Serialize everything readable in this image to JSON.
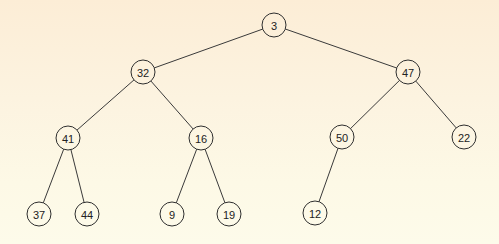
{
  "diagram": {
    "type": "binary-tree",
    "node_radius": 12,
    "nodes": [
      {
        "id": "n3",
        "label": "3",
        "x": 274,
        "y": 25
      },
      {
        "id": "n32",
        "label": "32",
        "x": 143,
        "y": 72
      },
      {
        "id": "n47",
        "label": "47",
        "x": 408,
        "y": 72
      },
      {
        "id": "n41",
        "label": "41",
        "x": 68,
        "y": 138
      },
      {
        "id": "n16",
        "label": "16",
        "x": 201,
        "y": 138
      },
      {
        "id": "n50",
        "label": "50",
        "x": 342,
        "y": 137
      },
      {
        "id": "n22",
        "label": "22",
        "x": 464,
        "y": 137
      },
      {
        "id": "n37",
        "label": "37",
        "x": 39,
        "y": 214
      },
      {
        "id": "n44",
        "label": "44",
        "x": 87,
        "y": 214
      },
      {
        "id": "n9",
        "label": "9",
        "x": 172,
        "y": 214
      },
      {
        "id": "n19",
        "label": "19",
        "x": 229,
        "y": 214
      },
      {
        "id": "n12",
        "label": "12",
        "x": 315,
        "y": 213
      }
    ],
    "edges": [
      {
        "from": "n3",
        "to": "n32"
      },
      {
        "from": "n3",
        "to": "n47"
      },
      {
        "from": "n32",
        "to": "n41"
      },
      {
        "from": "n32",
        "to": "n16"
      },
      {
        "from": "n47",
        "to": "n50"
      },
      {
        "from": "n47",
        "to": "n22"
      },
      {
        "from": "n41",
        "to": "n37"
      },
      {
        "from": "n41",
        "to": "n44"
      },
      {
        "from": "n16",
        "to": "n9"
      },
      {
        "from": "n16",
        "to": "n19"
      },
      {
        "from": "n50",
        "to": "n12"
      }
    ]
  }
}
